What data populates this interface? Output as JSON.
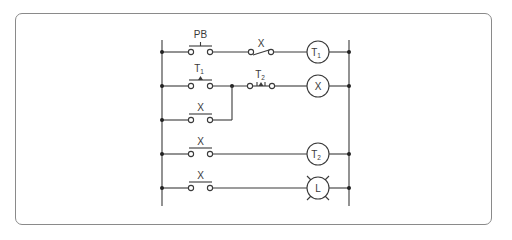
{
  "diagram": {
    "type": "ladder-logic",
    "colors": {
      "line": "#3a3a3a",
      "frame": "#8a8a8a",
      "background": "#ffffff"
    },
    "rungs": [
      {
        "contacts": [
          {
            "label": "PB",
            "sub": "",
            "kind": "NO-pushbutton"
          },
          {
            "label": "X",
            "sub": "",
            "kind": "NC"
          }
        ],
        "output": {
          "label": "T",
          "sub": "1",
          "kind": "timer-coil"
        }
      },
      {
        "contacts": [
          {
            "label": "T",
            "sub": "1",
            "kind": "NO-timed"
          },
          {
            "label": "T",
            "sub": "2",
            "kind": "NC-timed"
          }
        ],
        "output": {
          "label": "X",
          "sub": "",
          "kind": "relay-coil"
        }
      },
      {
        "contacts": [
          {
            "label": "X",
            "sub": "",
            "kind": "NO-seal-in"
          }
        ],
        "output": null
      },
      {
        "contacts": [
          {
            "label": "X",
            "sub": "",
            "kind": "NO"
          }
        ],
        "output": {
          "label": "T",
          "sub": "2",
          "kind": "timer-coil"
        }
      },
      {
        "contacts": [
          {
            "label": "X",
            "sub": "",
            "kind": "NO"
          }
        ],
        "output": {
          "label": "L",
          "sub": "",
          "kind": "lamp"
        }
      }
    ]
  }
}
